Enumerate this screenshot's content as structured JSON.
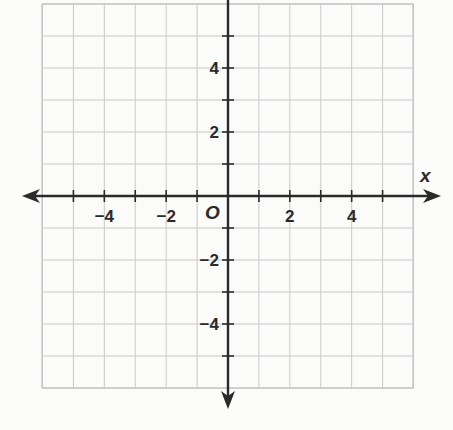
{
  "graph": {
    "title": "Coordinate plane",
    "x_axis": {
      "name": "x",
      "min": -6,
      "max": 6,
      "grid_step": 1,
      "labeled_ticks": [
        {
          "value": -4,
          "label": "−4"
        },
        {
          "value": -2,
          "label": "−2"
        },
        {
          "value": 2,
          "label": "2"
        },
        {
          "value": 4,
          "label": "4"
        }
      ]
    },
    "y_axis": {
      "name": "",
      "min": -6,
      "max": 6,
      "grid_step": 1,
      "labeled_ticks": [
        {
          "value": 4,
          "label": "4"
        },
        {
          "value": 2,
          "label": "2"
        },
        {
          "value": -2,
          "label": "−2"
        },
        {
          "value": -4,
          "label": "−4"
        }
      ]
    },
    "origin_label": "O",
    "colors": {
      "background": "#fbfbfa",
      "grid": "#c9c9c9",
      "axis": "#2a2a2a",
      "text": "#2a2a2a"
    }
  }
}
